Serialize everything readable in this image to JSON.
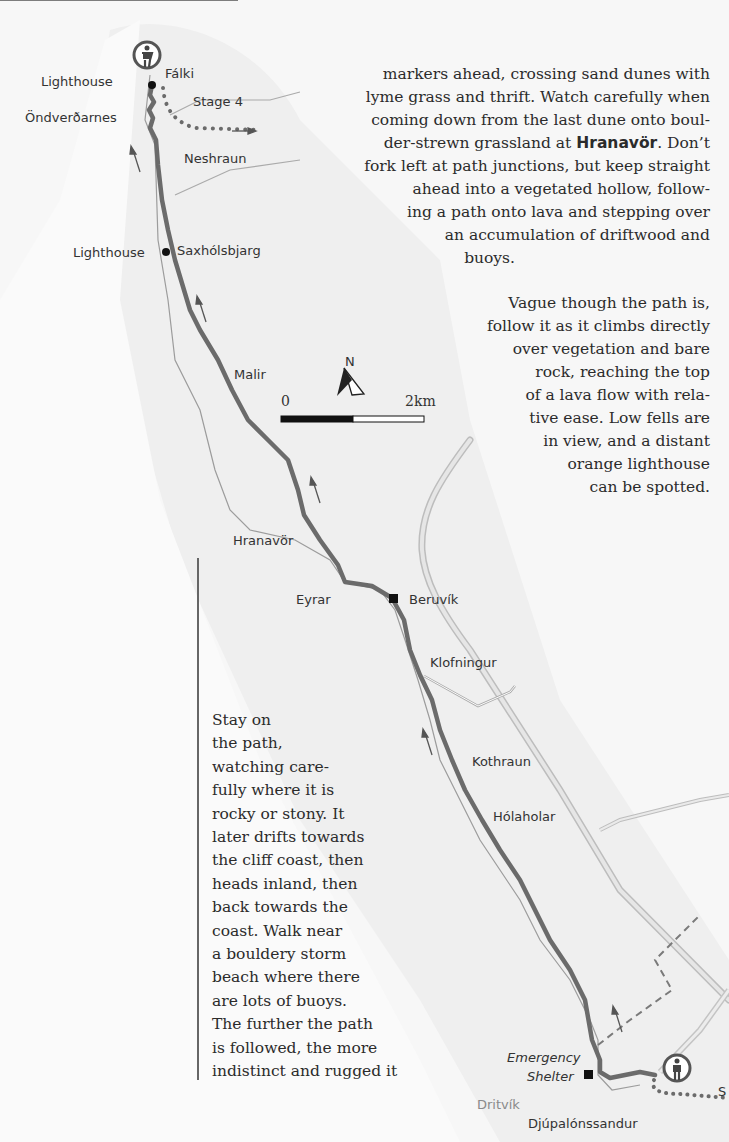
{
  "map": {
    "place_labels": {
      "lighthouse_top": "Lighthouse",
      "falki": "Fálki",
      "stage4": "Stage 4",
      "ondverdarnes": "Öndverðarnes",
      "neshraun": "Neshraun",
      "lighthouse_mid": "Lighthouse",
      "saxholsbjarg": "Saxhólsbjarg",
      "malir": "Malir",
      "hranavor": "Hranavör",
      "eyrar": "Eyrar",
      "beruvik": "Beruvík",
      "klofningur": "Klofningur",
      "kothraun": "Kothraun",
      "holaholar": "Hólaholar",
      "emergency_shelter_line1": "Emergency",
      "emergency_shelter_line2": "Shelter",
      "dritvik": "Dritvík",
      "djupalonssandur": "Djúpalónssandur",
      "next_stage_cut": "S"
    },
    "compass": {
      "label": "N"
    },
    "scale": {
      "start": "0",
      "end": "2km"
    },
    "icons": [
      "walker-icon-start",
      "walker-icon-end",
      "lighthouse-dot",
      "beruvik-square",
      "shelter-square"
    ],
    "colors": {
      "route": "#6b6b6b",
      "road": "#cfcfcf",
      "coast": "#9a9a9a",
      "background": "#f7f7f7",
      "land": "#ececec"
    }
  },
  "prose": {
    "top_lines": [
      "markers ahead, crossing sand dunes with",
      "lyme grass and thrift. Watch carefully when",
      "coming down from the last dune onto boul-",
      "der-strewn grassland at ",
      "fork left at path junctions, but keep straight",
      "ahead into a vegetated hollow, follow-",
      "ing a path onto lava and stepping over",
      "an accumulation of driftwood and",
      "buoys."
    ],
    "top_bold": "Hranavör",
    "top_after_bold": ". Don’t",
    "second_lines": [
      "Vague though the path is,",
      "follow it as it climbs directly",
      "over vegetation and bare",
      "rock, reaching the top",
      "of a lava flow with rela-",
      "tive ease. Low fells are",
      "in view, and a distant",
      "orange lighthouse",
      "can be spotted."
    ],
    "side_lines": [
      "Stay on",
      "the path,",
      "watching care-",
      "fully where it is",
      "rocky or stony. It",
      "later drifts towards",
      "the cliff coast, then",
      "heads inland, then",
      "back towards the",
      "coast. Walk near",
      "a bouldery storm",
      "beach where there",
      "are lots of buoys.",
      "The further the path",
      "is followed, the more",
      "indistinct and rugged it"
    ]
  }
}
